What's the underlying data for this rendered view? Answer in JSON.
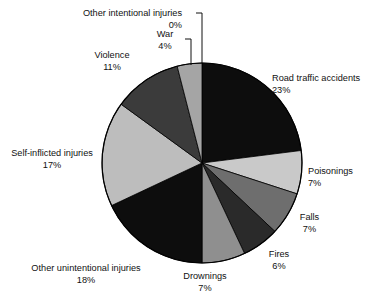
{
  "chart_data": {
    "type": "pie",
    "title": "",
    "subtitle": "",
    "xlabel": "",
    "ylabel": "",
    "legend_position": "none",
    "grid": false,
    "units": "percent",
    "start_angle_deg": 0,
    "direction": "clockwise",
    "categories": [
      "Road traffic accidents",
      "Poisonings",
      "Falls",
      "Fires",
      "Drownings",
      "Other unintentional injuries",
      "Self-inflicted injuries",
      "Violence",
      "War",
      "Other intentional injuries"
    ],
    "values": [
      23,
      7,
      7,
      6,
      7,
      18,
      17,
      11,
      4,
      0
    ],
    "colors": [
      "#0d0d0d",
      "#c9c9c9",
      "#6e6e6e",
      "#2a2a2a",
      "#8f8f8f",
      "#0d0d0d",
      "#bdbdbd",
      "#3b3b3b",
      "#a5a5a5",
      "#ffffff"
    ],
    "slices": [
      {
        "label": "Road traffic accidents",
        "value": 23,
        "value_text": "23%",
        "color": "#0d0d0d"
      },
      {
        "label": "Poisonings",
        "value": 7,
        "value_text": "7%",
        "color": "#c9c9c9"
      },
      {
        "label": "Falls",
        "value": 7,
        "value_text": "7%",
        "color": "#6e6e6e"
      },
      {
        "label": "Fires",
        "value": 6,
        "value_text": "6%",
        "color": "#2a2a2a"
      },
      {
        "label": "Drownings",
        "value": 7,
        "value_text": "7%",
        "color": "#8f8f8f"
      },
      {
        "label": "Other unintentional injuries",
        "value": 18,
        "value_text": "18%",
        "color": "#0d0d0d"
      },
      {
        "label": "Self-inflicted injuries",
        "value": 17,
        "value_text": "17%",
        "color": "#bdbdbd"
      },
      {
        "label": "Violence",
        "value": 11,
        "value_text": "11%",
        "color": "#3b3b3b"
      },
      {
        "label": "War",
        "value": 4,
        "value_text": "4%",
        "color": "#a5a5a5"
      },
      {
        "label": "Other intentional injuries",
        "value": 0,
        "value_text": "0%",
        "color": "#ffffff"
      }
    ],
    "outline_color": "#000000",
    "geometry": {
      "cx": 202,
      "cy": 163,
      "r": 100
    }
  },
  "labels": {
    "other_intentional": {
      "name": "Other intentional injuries",
      "pct": "0%"
    },
    "war": {
      "name": "War",
      "pct": "4%"
    },
    "violence": {
      "name": "Violence",
      "pct": "11%"
    },
    "self_inflicted": {
      "name": "Self-inflicted injuries",
      "pct": "17%"
    },
    "other_unintent": {
      "name": "Other unintentional injuries",
      "pct": "18%"
    },
    "drownings": {
      "name": "Drownings",
      "pct": "7%"
    },
    "fires": {
      "name": "Fires",
      "pct": "6%"
    },
    "falls": {
      "name": "Falls",
      "pct": "7%"
    },
    "poisonings": {
      "name": "Poisonings",
      "pct": "7%"
    },
    "road_traffic": {
      "name": "Road traffic accidents",
      "pct": "23%"
    }
  }
}
